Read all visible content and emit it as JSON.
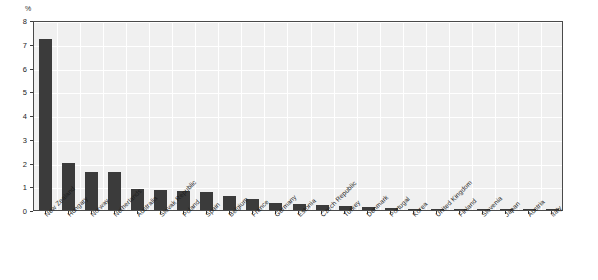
{
  "chart_data": {
    "type": "bar",
    "title": "",
    "subtitle": "",
    "xlabel": "",
    "ylabel": "%",
    "ylim": [
      0,
      8
    ],
    "ytick_values": [
      0,
      1,
      2,
      3,
      4,
      5,
      6,
      7,
      8
    ],
    "ytick_labels": [
      "0",
      "1",
      "2",
      "3",
      "4",
      "5",
      "6",
      "7",
      "8"
    ],
    "grid": true,
    "legend": false,
    "legend_position": "none",
    "orientation": "vertical",
    "bar_color": "#3b3b3b",
    "plot_background": "#f0f0f0",
    "gridline_color": "#ffffff",
    "axis_color": "#4a4a4a",
    "categories": [
      "New Zealand",
      "Hungary",
      "Norway",
      "Netherlands",
      "Australia",
      "Slovak Republic",
      "Poland",
      "Spain",
      "Belgium",
      "France",
      "Germany",
      "Estonia",
      "Czech Republic",
      "Turkey",
      "Denmark",
      "Portugal",
      "Korea",
      "United Kingdom",
      "Finland",
      "Slovenia",
      "Japan",
      "Austria",
      "Italy"
    ],
    "values": [
      7.22,
      1.97,
      1.6,
      1.58,
      0.89,
      0.85,
      0.79,
      0.74,
      0.58,
      0.47,
      0.31,
      0.27,
      0.23,
      0.19,
      0.11,
      0.09,
      0.06,
      0.05,
      0.04,
      0.03,
      0.02,
      0.02,
      0.02
    ],
    "series": [
      {
        "name": "%",
        "values": [
          7.22,
          1.97,
          1.6,
          1.58,
          0.89,
          0.85,
          0.79,
          0.74,
          0.58,
          0.47,
          0.31,
          0.27,
          0.23,
          0.19,
          0.11,
          0.09,
          0.06,
          0.05,
          0.04,
          0.03,
          0.02,
          0.02,
          0.02
        ]
      }
    ]
  },
  "axis": {
    "y_unit_label": "%"
  }
}
